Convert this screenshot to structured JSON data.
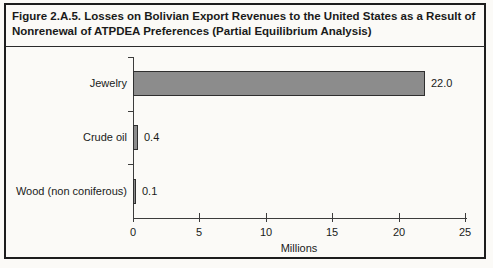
{
  "figure": {
    "title_line1": "Figure 2.A.5. Losses on Bolivian Export Revenues to the United States as a Result of",
    "title_line2": "Nonrenewal of ATPDEA Preferences (Partial Equilibrium Analysis)"
  },
  "chart_data": {
    "type": "bar",
    "orientation": "horizontal",
    "title": "Figure 2.A.5. Losses on Bolivian Export Revenues to the United States as a Result of Nonrenewal of ATPDEA Preferences (Partial Equilibrium Analysis)",
    "categories": [
      "Jewelry",
      "Crude oil",
      "Wood (non coniferous)"
    ],
    "values": [
      22.0,
      0.4,
      0.1
    ],
    "value_labels": [
      "22.0",
      "0.4",
      "0.1"
    ],
    "xlabel": "Millions",
    "xlim": [
      0,
      25
    ],
    "xticks": [
      0,
      5,
      10,
      15,
      20,
      25
    ],
    "grid": false,
    "legend": "none",
    "bar_fill": "#8c8c8c",
    "bar_border": "#2f2f2f",
    "axis_color": "#3c3c3c"
  }
}
